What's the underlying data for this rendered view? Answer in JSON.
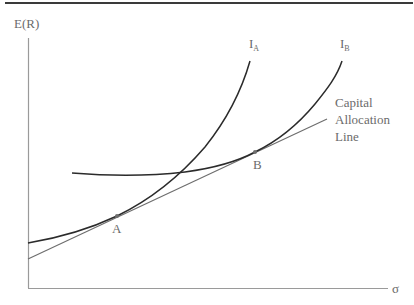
{
  "diagram": {
    "axes": {
      "y_label": "E(R)",
      "x_label": "σ"
    },
    "curves": [
      {
        "id": "IA",
        "label_main": "I",
        "label_sub": "A",
        "description": "Indifference curve A"
      },
      {
        "id": "IB",
        "label_main": "I",
        "label_sub": "B",
        "description": "Indifference curve B"
      }
    ],
    "cal": {
      "label_lines": [
        "Capital",
        "Allocation",
        "Line"
      ]
    },
    "points": [
      {
        "id": "A",
        "label": "A"
      },
      {
        "id": "B",
        "label": "B"
      }
    ],
    "colors": {
      "curve": "#2b2b2b",
      "cal": "#6e6e6e",
      "axis": "#9a9a9a",
      "text": "#6b6b6b",
      "top_rule": "#3a3a3a"
    }
  }
}
